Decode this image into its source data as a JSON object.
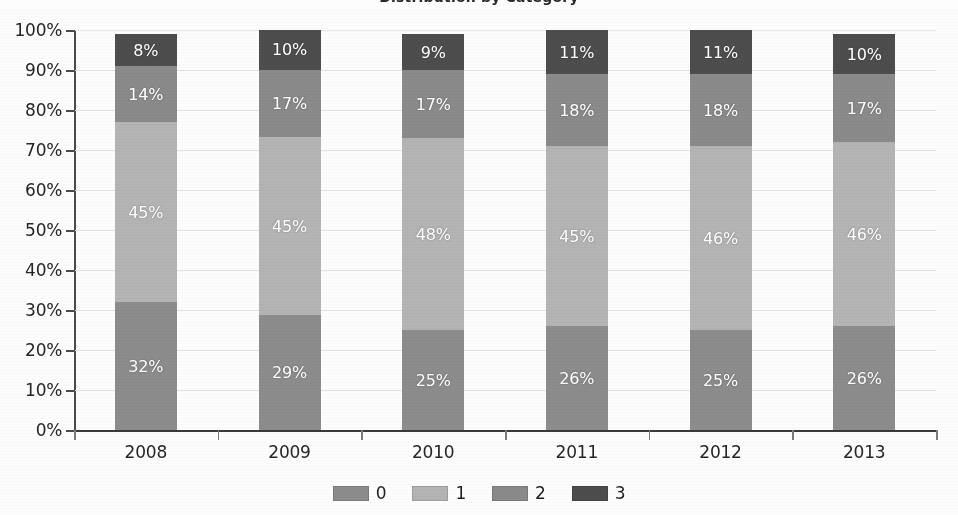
{
  "title": "Distribution by Category",
  "chart_data": {
    "type": "bar",
    "subtype": "100% stacked column",
    "title": "Distribution by Category",
    "xlabel": "",
    "ylabel": "",
    "categories": [
      "2008",
      "2009",
      "2010",
      "2011",
      "2012",
      "2013"
    ],
    "series": [
      {
        "name": "0",
        "color": "#8c8c8c",
        "values": [
          32,
          29,
          25,
          26,
          25,
          26
        ],
        "labels": [
          "32%",
          "29%",
          "25%",
          "26%",
          "25%",
          "26%"
        ]
      },
      {
        "name": "1",
        "color": "#b4b4b4",
        "values": [
          45,
          45,
          48,
          45,
          46,
          46
        ],
        "labels": [
          "45%",
          "45%",
          "48%",
          "45%",
          "46%",
          "46%"
        ]
      },
      {
        "name": "2",
        "color": "#8a8a8a",
        "values": [
          14,
          17,
          17,
          18,
          18,
          17
        ],
        "labels": [
          "14%",
          "17%",
          "17%",
          "18%",
          "18%",
          "17%"
        ]
      },
      {
        "name": "3",
        "color": "#4d4d4d",
        "values": [
          8,
          10,
          9,
          11,
          11,
          10
        ],
        "labels": [
          "8%",
          "10%",
          "9%",
          "11%",
          "11%",
          "10%"
        ]
      }
    ],
    "ylim": [
      0,
      100
    ],
    "ytick_values": [
      0,
      10,
      20,
      30,
      40,
      50,
      60,
      70,
      80,
      90,
      100
    ],
    "ytick_labels": [
      "0%",
      "10%",
      "20%",
      "30%",
      "40%",
      "50%",
      "60%",
      "70%",
      "80%",
      "90%",
      "100%"
    ],
    "grid": true,
    "legend_position": "bottom",
    "data_labels": true,
    "colors": {
      "series_0": "#8c8c8c",
      "series_1": "#b4b4b4",
      "series_2": "#8a8a8a",
      "series_3": "#4d4d4d",
      "gridline": "#e2e2e2",
      "axis": "#3a3a3a",
      "text": "#262626",
      "label_text": "#ffffff",
      "background": "#fdfdfd"
    }
  }
}
